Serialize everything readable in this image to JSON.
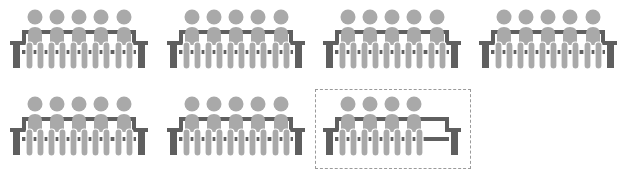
{
  "colors": {
    "person": "#a9a9a9",
    "bench": "#5f5f5f",
    "gap": "#ffffff",
    "highlight_border": "#9a9a9a"
  },
  "benches": [
    {
      "row": 0,
      "col": 0,
      "people": 5,
      "highlighted": false
    },
    {
      "row": 0,
      "col": 1,
      "people": 5,
      "highlighted": false
    },
    {
      "row": 0,
      "col": 2,
      "people": 5,
      "highlighted": false
    },
    {
      "row": 0,
      "col": 3,
      "people": 5,
      "highlighted": false
    },
    {
      "row": 1,
      "col": 0,
      "people": 5,
      "highlighted": false
    },
    {
      "row": 1,
      "col": 1,
      "people": 5,
      "highlighted": false
    },
    {
      "row": 1,
      "col": 2,
      "people": 4,
      "highlighted": true
    }
  ],
  "icon": "bench-with-seated-people-icon"
}
